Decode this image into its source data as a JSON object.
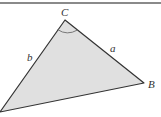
{
  "figure": {
    "type": "triangle",
    "fill_color": "#e0e0e0",
    "stroke_color": "#333333",
    "vertices": {
      "A": {
        "x": 0,
        "y": 112,
        "label": ""
      },
      "B": {
        "x": 144,
        "y": 83,
        "label": "B"
      },
      "C": {
        "x": 65,
        "y": 20,
        "label": "C"
      }
    },
    "sides": {
      "a": {
        "label": "a"
      },
      "b": {
        "label": "b"
      }
    },
    "angle_mark": {
      "vertex": "C"
    }
  }
}
